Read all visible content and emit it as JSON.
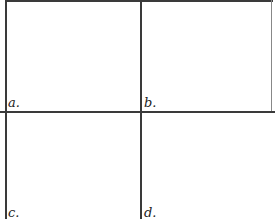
{
  "figure": {
    "panels": [
      {
        "label": "a."
      },
      {
        "label": "b."
      },
      {
        "label": "c."
      },
      {
        "label": "d."
      }
    ],
    "line_color": "#3a3a3a"
  }
}
